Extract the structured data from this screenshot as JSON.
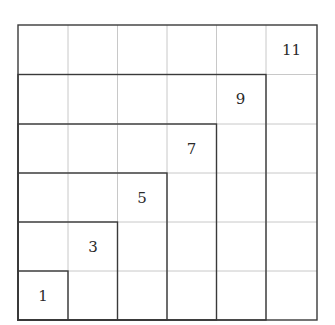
{
  "diagram": {
    "grid_size": 6,
    "labels": [
      {
        "value": "1",
        "row": 5,
        "col": 0
      },
      {
        "value": "3",
        "row": 4,
        "col": 1
      },
      {
        "value": "5",
        "row": 3,
        "col": 2
      },
      {
        "value": "7",
        "row": 2,
        "col": 3
      },
      {
        "value": "9",
        "row": 1,
        "col": 4
      },
      {
        "value": "11",
        "row": 0,
        "col": 5
      }
    ],
    "colors": {
      "heavy_line": "#3a3a3a",
      "light_line": "#c8c8c8",
      "text": "#2a2a2a"
    }
  }
}
